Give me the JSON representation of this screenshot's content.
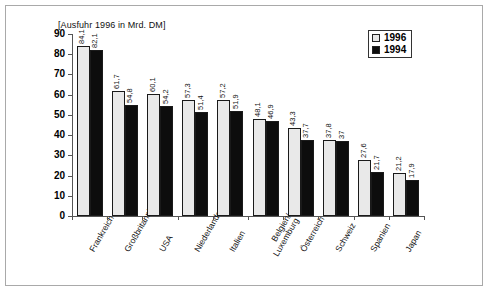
{
  "chart_title": "[Ausfuhr 1996 in Mrd. DM]",
  "legend": {
    "position": "top-right",
    "entries": [
      {
        "label": "1996",
        "swatch": "light-gray-square",
        "color": "#e8e8e8"
      },
      {
        "label": "1994",
        "swatch": "black-square",
        "color": "#0d0d0d"
      }
    ]
  },
  "chart_data": {
    "type": "bar",
    "title": "[Ausfuhr 1996 in Mrd. DM]",
    "xlabel": "",
    "ylabel": "",
    "ylim": [
      0,
      90
    ],
    "yticks": [
      0,
      10,
      20,
      30,
      40,
      50,
      60,
      70,
      80,
      90
    ],
    "grid": false,
    "legend_position": "top-right",
    "categories": [
      "Frankreich",
      "Großbritannien",
      "USA",
      "Niederlande",
      "Italien",
      "Belgien/ Luxemburg",
      "Österreich",
      "Schweiz",
      "Spanien",
      "Japan"
    ],
    "category_lines": [
      [
        "Frankreich",
        ""
      ],
      [
        "Großbritannien",
        ""
      ],
      [
        "USA",
        ""
      ],
      [
        "Niederlande",
        ""
      ],
      [
        "Italien",
        ""
      ],
      [
        "Belgien/",
        "Luxemburg"
      ],
      [
        "Österreich",
        ""
      ],
      [
        "Schweiz",
        ""
      ],
      [
        "Spanien",
        ""
      ],
      [
        "Japan",
        ""
      ]
    ],
    "series": [
      {
        "name": "1996",
        "color": "#e8e8e8",
        "values": [
          84.1,
          61.7,
          60.1,
          57.3,
          57.2,
          48.1,
          43.3,
          37.8,
          27.6,
          21.2
        ],
        "labels": [
          "84,1",
          "61,7",
          "60,1",
          "57,3",
          "57,2",
          "48,1",
          "43,3",
          "37,8",
          "27,6",
          "21,2"
        ]
      },
      {
        "name": "1994",
        "color": "#0d0d0d",
        "values": [
          82.1,
          54.8,
          54.2,
          51.4,
          51.9,
          46.9,
          37.7,
          37.0,
          21.7,
          17.9
        ],
        "labels": [
          "82,1",
          "54,8",
          "54,2",
          "51,4",
          "51,9",
          "46,9",
          "37,7",
          "37",
          "21,7",
          "17,9"
        ]
      }
    ]
  }
}
